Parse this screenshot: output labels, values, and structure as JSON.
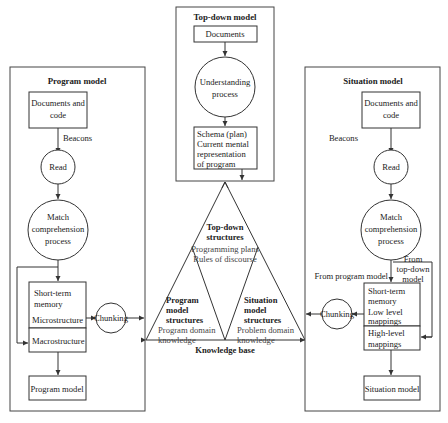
{
  "program_model": {
    "title": "Program model",
    "documents": [
      "Documents and",
      "code"
    ],
    "beacons": "Beacons",
    "read": "Read",
    "match": [
      "Match",
      "comprehension",
      "process"
    ],
    "stm": [
      "Short-term",
      "memory"
    ],
    "microstructure": "Microstructure",
    "macrostructure": "Macrostructure",
    "chunking": "Chunking",
    "output": "Program model"
  },
  "top_down_model": {
    "title": "Top-down model",
    "documents": "Documents",
    "understanding": [
      "Understanding",
      "process"
    ],
    "schema": [
      "Schema (plan)",
      "Current mental",
      "representation",
      "of program"
    ]
  },
  "knowledge_base": {
    "label": "Knowledge base",
    "top_down": {
      "title": [
        "Top-down",
        "structures"
      ],
      "items": [
        "Programming plans",
        "Rules of discourse"
      ]
    },
    "program": {
      "title": [
        "Program",
        "model",
        "structures"
      ],
      "items": [
        "Program domain",
        "knowledge"
      ]
    },
    "situation": {
      "title": [
        "Situation",
        "model",
        "structures"
      ],
      "items": [
        "Problem domain",
        "knowledge"
      ]
    }
  },
  "situation_model": {
    "title": "Situation model",
    "documents": [
      "Documents and",
      "code"
    ],
    "beacons": "Beacons",
    "read": "Read",
    "match": [
      "Match",
      "comprehension",
      "process"
    ],
    "from_program": "From program model",
    "from_top_down": [
      "From",
      "top-down",
      "model"
    ],
    "stm": [
      "Short-term",
      "memory"
    ],
    "low_level": [
      "Low level",
      "mappings"
    ],
    "high_level": [
      "High-level",
      "mappings"
    ],
    "chunking": "Chunking",
    "output": "Situation model"
  }
}
